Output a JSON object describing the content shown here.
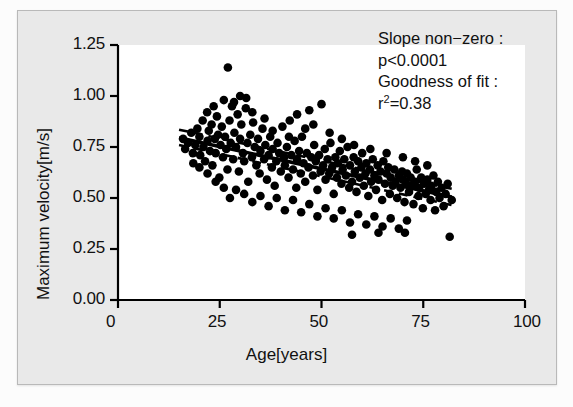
{
  "chart_data": {
    "type": "scatter",
    "title": "",
    "xlabel": "Age[years]",
    "ylabel": "Maximum velocity[m/s]",
    "xlim": [
      0,
      100
    ],
    "ylim": [
      0.0,
      1.25
    ],
    "xticks": [
      0,
      25,
      50,
      75,
      100
    ],
    "xtick_labels": [
      "0",
      "25",
      "50",
      "75",
      "100"
    ],
    "yticks": [
      0.0,
      0.25,
      0.5,
      0.75,
      1.0,
      1.25
    ],
    "ytick_labels": [
      "0.00",
      "0.25",
      "0.50",
      "0.75",
      "1.00",
      "1.25"
    ],
    "grid": false,
    "legend": null,
    "marker": "filled-circle",
    "marker_color": "#000000",
    "points": [
      [
        16.0,
        0.79
      ],
      [
        16.5,
        0.74
      ],
      [
        17.2,
        0.77
      ],
      [
        18.0,
        0.82
      ],
      [
        18.4,
        0.72
      ],
      [
        19.0,
        0.76
      ],
      [
        19.5,
        0.84
      ],
      [
        20.0,
        0.8
      ],
      [
        20.2,
        0.71
      ],
      [
        20.8,
        0.88
      ],
      [
        21.0,
        0.75
      ],
      [
        21.4,
        0.68
      ],
      [
        21.9,
        0.92
      ],
      [
        22.0,
        0.78
      ],
      [
        22.3,
        0.83
      ],
      [
        22.6,
        0.73
      ],
      [
        23.0,
        0.86
      ],
      [
        23.2,
        0.66
      ],
      [
        23.5,
        0.95
      ],
      [
        23.8,
        0.79
      ],
      [
        24.0,
        0.72
      ],
      [
        24.3,
        0.9
      ],
      [
        24.6,
        0.81
      ],
      [
        24.9,
        0.6
      ],
      [
        25.2,
        0.76
      ],
      [
        25.5,
        0.85
      ],
      [
        25.8,
        0.7
      ],
      [
        26.0,
        0.98
      ],
      [
        26.3,
        0.8
      ],
      [
        26.6,
        0.74
      ],
      [
        26.9,
        0.64
      ],
      [
        27.0,
        1.14
      ],
      [
        27.4,
        0.88
      ],
      [
        27.7,
        0.77
      ],
      [
        28.0,
        0.95
      ],
      [
        28.3,
        0.69
      ],
      [
        28.6,
        0.82
      ],
      [
        29.0,
        0.75
      ],
      [
        29.4,
        0.91
      ],
      [
        29.7,
        0.63
      ],
      [
        30.0,
        0.79
      ],
      [
        30.3,
        0.86
      ],
      [
        30.7,
        0.72
      ],
      [
        31.0,
        0.68
      ],
      [
        31.4,
        0.94
      ],
      [
        31.8,
        0.77
      ],
      [
        32.0,
        0.58
      ],
      [
        32.5,
        0.81
      ],
      [
        32.9,
        0.7
      ],
      [
        33.2,
        0.87
      ],
      [
        33.6,
        0.75
      ],
      [
        34.0,
        0.66
      ],
      [
        34.4,
        0.79
      ],
      [
        34.8,
        0.62
      ],
      [
        35.0,
        0.73
      ],
      [
        35.5,
        0.84
      ],
      [
        35.9,
        0.69
      ],
      [
        36.2,
        0.76
      ],
      [
        36.6,
        0.59
      ],
      [
        37.0,
        0.71
      ],
      [
        37.4,
        0.8
      ],
      [
        37.8,
        0.65
      ],
      [
        38.0,
        0.74
      ],
      [
        38.5,
        0.56
      ],
      [
        38.9,
        0.68
      ],
      [
        39.2,
        0.77
      ],
      [
        39.6,
        0.72
      ],
      [
        40.0,
        0.63
      ],
      [
        40.4,
        0.85
      ],
      [
        40.8,
        0.7
      ],
      [
        41.0,
        0.66
      ],
      [
        41.5,
        0.75
      ],
      [
        41.9,
        0.6
      ],
      [
        42.2,
        0.88
      ],
      [
        42.6,
        0.71
      ],
      [
        43.0,
        0.64
      ],
      [
        43.4,
        0.78
      ],
      [
        43.8,
        0.55
      ],
      [
        44.0,
        0.69
      ],
      [
        44.5,
        0.73
      ],
      [
        44.9,
        0.62
      ],
      [
        45.2,
        0.8
      ],
      [
        45.6,
        0.67
      ],
      [
        46.0,
        0.58
      ],
      [
        46.4,
        0.72
      ],
      [
        46.8,
        0.65
      ],
      [
        47.0,
        0.93
      ],
      [
        47.5,
        0.7
      ],
      [
        47.9,
        0.61
      ],
      [
        48.2,
        0.76
      ],
      [
        48.6,
        0.68
      ],
      [
        49.0,
        0.54
      ],
      [
        49.4,
        0.71
      ],
      [
        49.8,
        0.63
      ],
      [
        50.0,
        0.96
      ],
      [
        50.4,
        0.66
      ],
      [
        50.8,
        0.74
      ],
      [
        51.0,
        0.59
      ],
      [
        51.5,
        0.69
      ],
      [
        51.9,
        0.62
      ],
      [
        52.2,
        0.77
      ],
      [
        52.6,
        0.65
      ],
      [
        53.0,
        0.52
      ],
      [
        53.4,
        0.7
      ],
      [
        53.8,
        0.6
      ],
      [
        54.0,
        0.67
      ],
      [
        54.5,
        0.73
      ],
      [
        54.9,
        0.57
      ],
      [
        55.2,
        0.64
      ],
      [
        55.6,
        0.69
      ],
      [
        56.0,
        0.61
      ],
      [
        56.4,
        0.75
      ],
      [
        56.8,
        0.55
      ],
      [
        57.0,
        0.66
      ],
      [
        57.5,
        0.58
      ],
      [
        57.9,
        0.7
      ],
      [
        58.2,
        0.63
      ],
      [
        58.6,
        0.53
      ],
      [
        59.0,
        0.68
      ],
      [
        59.4,
        0.6
      ],
      [
        59.8,
        0.65
      ],
      [
        60.0,
        0.72
      ],
      [
        60.4,
        0.56
      ],
      [
        60.8,
        0.62
      ],
      [
        61.0,
        0.67
      ],
      [
        61.5,
        0.51
      ],
      [
        61.9,
        0.64
      ],
      [
        62.2,
        0.58
      ],
      [
        62.6,
        0.69
      ],
      [
        63.0,
        0.61
      ],
      [
        63.4,
        0.54
      ],
      [
        63.8,
        0.66
      ],
      [
        64.0,
        0.59
      ],
      [
        64.5,
        0.63
      ],
      [
        64.9,
        0.49
      ],
      [
        65.2,
        0.68
      ],
      [
        65.6,
        0.57
      ],
      [
        66.0,
        0.62
      ],
      [
        66.4,
        0.65
      ],
      [
        66.8,
        0.52
      ],
      [
        67.0,
        0.6
      ],
      [
        67.5,
        0.56
      ],
      [
        67.9,
        0.64
      ],
      [
        68.2,
        0.58
      ],
      [
        68.6,
        0.5
      ],
      [
        69.0,
        0.61
      ],
      [
        69.4,
        0.55
      ],
      [
        69.8,
        0.63
      ],
      [
        70.0,
        0.59
      ],
      [
        70.4,
        0.48
      ],
      [
        70.8,
        0.57
      ],
      [
        71.0,
        0.62
      ],
      [
        71.5,
        0.53
      ],
      [
        71.9,
        0.6
      ],
      [
        72.2,
        0.56
      ],
      [
        72.6,
        0.47
      ],
      [
        73.0,
        0.58
      ],
      [
        73.4,
        0.64
      ],
      [
        73.8,
        0.51
      ],
      [
        74.0,
        0.55
      ],
      [
        74.5,
        0.6
      ],
      [
        74.9,
        0.45
      ],
      [
        75.2,
        0.57
      ],
      [
        75.6,
        0.52
      ],
      [
        76.0,
        0.59
      ],
      [
        76.4,
        0.54
      ],
      [
        76.8,
        0.49
      ],
      [
        77.0,
        0.56
      ],
      [
        77.5,
        0.61
      ],
      [
        77.9,
        0.44
      ],
      [
        78.2,
        0.53
      ],
      [
        78.6,
        0.58
      ],
      [
        79.0,
        0.5
      ],
      [
        79.5,
        0.55
      ],
      [
        80.0,
        0.46
      ],
      [
        80.5,
        0.52
      ],
      [
        81.0,
        0.57
      ],
      [
        81.5,
        0.31
      ],
      [
        82.0,
        0.49
      ],
      [
        27.5,
        0.5
      ],
      [
        29.0,
        0.54
      ],
      [
        31.0,
        0.52
      ],
      [
        33.0,
        0.48
      ],
      [
        35.0,
        0.51
      ],
      [
        37.0,
        0.46
      ],
      [
        39.0,
        0.5
      ],
      [
        41.0,
        0.44
      ],
      [
        43.0,
        0.49
      ],
      [
        45.0,
        0.43
      ],
      [
        47.0,
        0.47
      ],
      [
        49.0,
        0.41
      ],
      [
        51.0,
        0.45
      ],
      [
        53.0,
        0.4
      ],
      [
        55.0,
        0.44
      ],
      [
        57.0,
        0.38
      ],
      [
        59.0,
        0.42
      ],
      [
        61.0,
        0.37
      ],
      [
        63.0,
        0.41
      ],
      [
        65.0,
        0.36
      ],
      [
        67.0,
        0.4
      ],
      [
        69.0,
        0.35
      ],
      [
        71.0,
        0.39
      ],
      [
        57.5,
        0.32
      ],
      [
        64.0,
        0.33
      ],
      [
        70.5,
        0.33
      ],
      [
        24.0,
        0.58
      ],
      [
        26.0,
        0.55
      ],
      [
        22.0,
        0.62
      ],
      [
        20.0,
        0.65
      ],
      [
        18.5,
        0.67
      ],
      [
        44.0,
        0.91
      ],
      [
        46.0,
        0.84
      ],
      [
        48.0,
        0.86
      ],
      [
        30.0,
        1.0
      ],
      [
        31.5,
        0.99
      ],
      [
        28.5,
        0.97
      ],
      [
        33.0,
        0.92
      ],
      [
        36.0,
        0.89
      ],
      [
        38.0,
        0.83
      ],
      [
        42.0,
        0.8
      ],
      [
        52.0,
        0.82
      ],
      [
        55.0,
        0.79
      ],
      [
        58.0,
        0.76
      ],
      [
        62.0,
        0.74
      ],
      [
        66.0,
        0.72
      ],
      [
        70.0,
        0.7
      ],
      [
        73.0,
        0.68
      ],
      [
        76.0,
        0.66
      ]
    ],
    "fit_line": {
      "style": "solid",
      "color": "#000000",
      "x_start": 15.0,
      "x_end": 82.0,
      "y_start": 0.795,
      "y_end": 0.505
    },
    "confidence_bands": [
      {
        "style": "dashed",
        "color": "#000000",
        "x_start": 15.0,
        "x_end": 82.0,
        "y_start": 0.835,
        "y_end": 0.545
      },
      {
        "style": "dashed",
        "color": "#000000",
        "x_start": 15.0,
        "x_end": 82.0,
        "y_start": 0.76,
        "y_end": 0.465
      }
    ],
    "annotations": [
      "Slope non−zero :",
      "p<0.0001",
      "Goodness of fit :",
      "r2=0.38"
    ],
    "statistics": {
      "slope_test_label": "Slope non−zero :",
      "p_value": "p<0.0001",
      "goodness_label": "Goodness of fit :",
      "r_squared_prefix": "r",
      "r_squared_exponent": "2",
      "r_squared_value": "=0.38"
    },
    "colors": {
      "background": "#e9e9e9",
      "plot_background": "#ffffff",
      "axis": "#000000",
      "text": "#111111",
      "frame_border": "#b9b9b9"
    }
  }
}
